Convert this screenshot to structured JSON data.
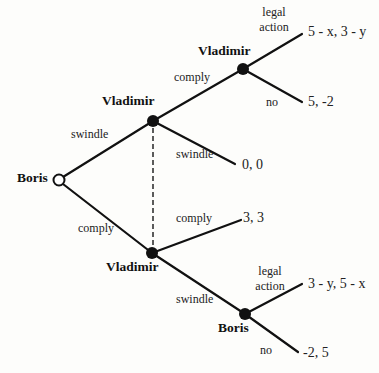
{
  "diagram": {
    "type": "game-tree",
    "nodes": [
      {
        "id": "root",
        "player": "Boris",
        "x": 59,
        "y": 180,
        "style": "open"
      },
      {
        "id": "v_top",
        "player": "Vladimir",
        "x": 153,
        "y": 121,
        "style": "filled"
      },
      {
        "id": "v_bottom",
        "player": "Vladimir",
        "x": 152,
        "y": 253,
        "style": "filled"
      },
      {
        "id": "v_right",
        "player": "Vladimir",
        "x": 243,
        "y": 69,
        "style": "filled"
      },
      {
        "id": "b_bottom",
        "player": "Boris",
        "x": 245,
        "y": 314,
        "style": "filled"
      }
    ],
    "actions": {
      "root_swindle": "swindle",
      "root_comply": "comply",
      "vtop_comply": "comply",
      "vtop_swindle": "swindle",
      "vright_legal_1": "legal",
      "vright_legal_2": "action",
      "vright_no": "no",
      "vbottom_comply": "comply",
      "vbottom_swindle": "swindle",
      "bbottom_legal_1": "legal",
      "bbottom_legal_2": "action",
      "bbottom_no": "no"
    },
    "payoffs": {
      "p1": "5 - x, 3 - y",
      "p2": "5, -2",
      "p3": "0, 0",
      "p4": "3, 3",
      "p5": "3 - y, 5 - x",
      "p6": "-2, 5"
    },
    "players": {
      "root": "Boris",
      "v_top": "Vladimir",
      "v_right": "Vladimir",
      "v_bottom": "Vladimir",
      "b_bottom": "Boris"
    },
    "information_set": "dashed line connecting Vladimir nodes"
  }
}
